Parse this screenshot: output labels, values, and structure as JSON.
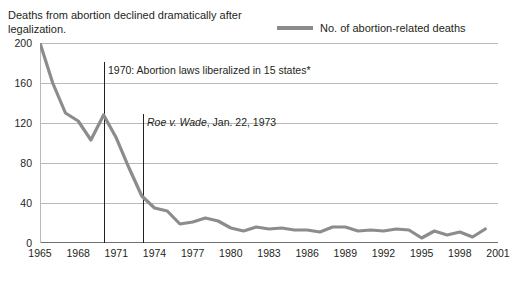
{
  "title": "Deaths from abortion declined dramatically after legalization.",
  "legend": {
    "label": "No. of abortion-related deaths",
    "color": "#8c8c8c"
  },
  "annotations": [
    {
      "id": "anno-1970",
      "text": "1970: Abortion laws liberalized in 15 states*",
      "year": 1970
    },
    {
      "id": "anno-roe",
      "text_italic": "Roe v. Wade",
      "text_rest": ", Jan. 22, 1973",
      "year": 1973.06
    }
  ],
  "chart_data": {
    "type": "line",
    "title": "Deaths from abortion declined dramatically after legalization.",
    "xlabel": "",
    "ylabel": "",
    "ylim": [
      0,
      200
    ],
    "xlim": [
      1965,
      2001
    ],
    "grid": true,
    "legend_position": "top-right",
    "yticks": [
      0,
      40,
      80,
      120,
      160,
      200
    ],
    "xticks": [
      1965,
      1968,
      1971,
      1974,
      1977,
      1980,
      1983,
      1986,
      1989,
      1992,
      1995,
      1998,
      2001
    ],
    "series": [
      {
        "name": "No. of abortion-related deaths",
        "color": "#8c8c8c",
        "x": [
          1965,
          1966,
          1967,
          1968,
          1969,
          1970,
          1971,
          1972,
          1973,
          1974,
          1975,
          1976,
          1977,
          1978,
          1979,
          1980,
          1981,
          1982,
          1983,
          1984,
          1985,
          1986,
          1987,
          1988,
          1989,
          1990,
          1991,
          1992,
          1993,
          1994,
          1995,
          1996,
          1997,
          1998,
          1999,
          2000
        ],
        "values": [
          200,
          160,
          130,
          122,
          103,
          128,
          105,
          75,
          47,
          35,
          32,
          19,
          21,
          25,
          22,
          15,
          12,
          16,
          14,
          15,
          13,
          13,
          11,
          16,
          16,
          12,
          13,
          12,
          14,
          13,
          5,
          12,
          8,
          11,
          6,
          14
        ]
      }
    ]
  }
}
